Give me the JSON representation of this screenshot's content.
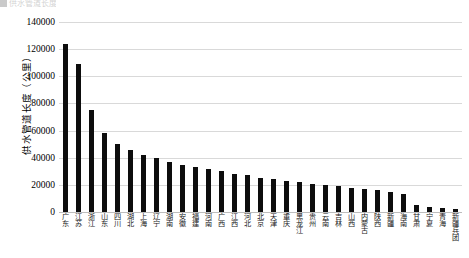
{
  "legend_remnant": {
    "text": "供水管道长度"
  },
  "chart_data": {
    "type": "bar",
    "title": "",
    "xlabel": "",
    "ylabel": "供水管道长度（公里）",
    "ylim": [
      0,
      140000
    ],
    "ytick_values": [
      140000,
      120000,
      100000,
      80000,
      60000,
      40000,
      20000,
      0
    ],
    "ytick_labels": [
      "140000",
      "120000",
      "100000",
      "80000",
      "60000",
      "40000",
      "20000",
      "0"
    ],
    "grid": true,
    "legend": "none",
    "bar_color": "#0d0d0d",
    "categories": [
      "广东",
      "江苏",
      "浙江",
      "山东",
      "四川",
      "湖北",
      "上海",
      "辽宁",
      "湖南",
      "安徽",
      "福建",
      "河南",
      "广西",
      "江西",
      "河北",
      "北京",
      "天津",
      "重庆",
      "黑龙江",
      "贵州",
      "云南",
      "吉林",
      "山西",
      "内蒙古",
      "陕西",
      "新疆",
      "海南",
      "甘肃",
      "宁夏",
      "青海",
      "新疆兵团"
    ],
    "values": [
      124000,
      109000,
      75000,
      58000,
      50000,
      46000,
      42000,
      40000,
      37000,
      35000,
      33000,
      32000,
      30000,
      28000,
      27000,
      25000,
      24000,
      23000,
      22000,
      21000,
      20000,
      19000,
      18000,
      17000,
      16000,
      15000,
      13000,
      5000,
      3500,
      3000,
      2500
    ]
  }
}
